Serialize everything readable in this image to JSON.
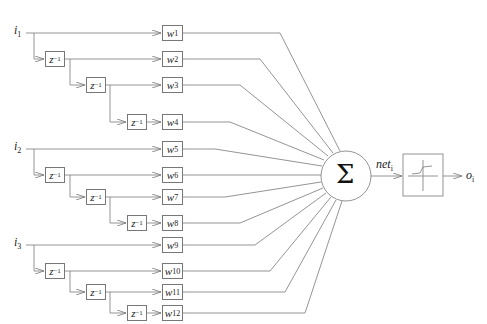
{
  "diagram": {
    "inputs": [
      {
        "label": "i",
        "sub": "1"
      },
      {
        "label": "i",
        "sub": "2"
      },
      {
        "label": "i",
        "sub": "3"
      }
    ],
    "delay_label": "z",
    "delay_sup": "−1",
    "weights": [
      {
        "label": "w",
        "sub": "1"
      },
      {
        "label": "w",
        "sub": "2"
      },
      {
        "label": "w",
        "sub": "3"
      },
      {
        "label": "w",
        "sub": "4"
      },
      {
        "label": "w",
        "sub": "5"
      },
      {
        "label": "w",
        "sub": "6"
      },
      {
        "label": "w",
        "sub": "7"
      },
      {
        "label": "w",
        "sub": "8"
      },
      {
        "label": "w",
        "sub": "9"
      },
      {
        "label": "w",
        "sub": "10"
      },
      {
        "label": "w",
        "sub": "11"
      },
      {
        "label": "w",
        "sub": "12"
      }
    ],
    "sum_symbol": "Σ",
    "net_label": "net",
    "net_sub": "i",
    "output_label": "o",
    "output_sub": "i",
    "colors": {
      "line": "#777777",
      "text": "#222222"
    }
  }
}
